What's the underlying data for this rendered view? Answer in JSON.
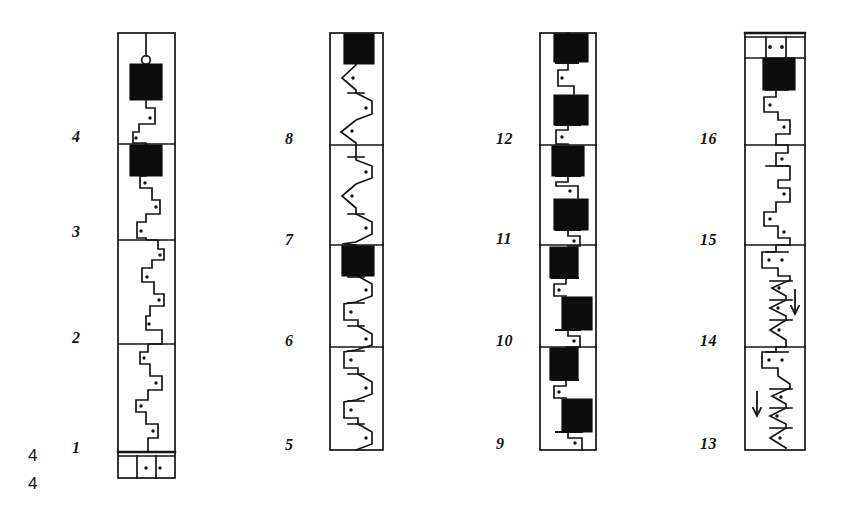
{
  "figure": {
    "kind": "hand-drawn stratigraphic core-log figure",
    "background_color": "#ffffff",
    "ink_color": "#141414",
    "fill_color": "#0d0d0d",
    "width": 843,
    "height": 515,
    "corner_labels": [
      {
        "text": "4",
        "x": 28,
        "y": 455
      },
      {
        "text": "4",
        "x": 28,
        "y": 483
      }
    ],
    "columns": [
      {
        "id": "column-1",
        "name": "core-log-column-1",
        "x": 118,
        "y": 33,
        "width": 57,
        "height": 445,
        "pattern": "stepped-rectilinear",
        "section_labels": [
          {
            "text": "4",
            "label_x": 72,
            "label_y": 129,
            "boundary_y": 144
          },
          {
            "text": "3",
            "label_x": 72,
            "label_y": 224,
            "boundary_y": 240
          },
          {
            "text": "2",
            "label_x": 72,
            "label_y": 330,
            "boundary_y": 344
          },
          {
            "text": "1",
            "label_x": 72,
            "label_y": 440,
            "boundary_y": 452
          }
        ],
        "has_top_hanger": true,
        "has_bottom_cap": true,
        "bottom_cap": {
          "y": 452,
          "height": 26,
          "cells": 4,
          "dot_cells": [
            1,
            2
          ]
        },
        "black_blocks": [
          {
            "y": 63,
            "height": 38,
            "left_offset": 12,
            "width": 32
          },
          {
            "y": 144,
            "height": 32,
            "left_offset": 12,
            "width": 32
          }
        ],
        "arrows": []
      },
      {
        "id": "column-2",
        "name": "core-log-column-2",
        "x": 330,
        "y": 33,
        "width": 53,
        "height": 417,
        "pattern": "triangular-zigzag",
        "section_labels": [
          {
            "text": "8",
            "label_x": 285,
            "label_y": 131,
            "boundary_y": 145
          },
          {
            "text": "7",
            "label_x": 285,
            "label_y": 232,
            "boundary_y": 245
          },
          {
            "text": "6",
            "label_x": 285,
            "label_y": 333,
            "boundary_y": 347
          },
          {
            "text": "5",
            "label_x": 285,
            "label_y": 437,
            "boundary_y": 450
          }
        ],
        "has_top_hanger": false,
        "has_bottom_cap": false,
        "black_blocks": [
          {
            "y": 35,
            "height": 30,
            "left_offset": 14,
            "width": 30
          },
          {
            "y": 245,
            "height": 30,
            "left_offset": 12,
            "width": 32
          }
        ],
        "arrows": []
      },
      {
        "id": "column-3",
        "name": "core-log-column-3",
        "x": 540,
        "y": 33,
        "width": 56,
        "height": 417,
        "pattern": "stepped-blocky",
        "section_labels": [
          {
            "text": "12",
            "label_x": 496,
            "label_y": 131,
            "boundary_y": 145
          },
          {
            "text": "11",
            "label_x": 496,
            "label_y": 231,
            "boundary_y": 245
          },
          {
            "text": "10",
            "label_x": 496,
            "label_y": 333,
            "boundary_y": 347
          },
          {
            "text": "9",
            "label_x": 496,
            "label_y": 436,
            "boundary_y": 450
          }
        ],
        "has_top_hanger": true,
        "has_bottom_cap": false,
        "black_blocks": [
          {
            "y": 35,
            "height": 28,
            "left_offset": 14,
            "width": 34
          },
          {
            "y": 95,
            "height": 30,
            "left_offset": 14,
            "width": 34
          },
          {
            "y": 145,
            "height": 30,
            "left_offset": 12,
            "width": 32
          },
          {
            "y": 198,
            "height": 32,
            "left_offset": 14,
            "width": 34
          },
          {
            "y": 246,
            "height": 32,
            "left_offset": 10,
            "width": 28
          },
          {
            "y": 298,
            "height": 32,
            "left_offset": 22,
            "width": 30
          },
          {
            "y": 348,
            "height": 32,
            "left_offset": 10,
            "width": 28
          },
          {
            "y": 400,
            "height": 32,
            "left_offset": 22,
            "width": 30
          }
        ],
        "arrows": []
      },
      {
        "id": "column-4",
        "name": "core-log-column-4",
        "x": 745,
        "y": 33,
        "width": 60,
        "height": 417,
        "pattern": "mixed-stepped-triangular",
        "section_labels": [
          {
            "text": "16",
            "label_x": 700,
            "label_y": 131,
            "boundary_y": 145
          },
          {
            "text": "15",
            "label_x": 700,
            "label_y": 232,
            "boundary_y": 245
          },
          {
            "text": "14",
            "label_x": 700,
            "label_y": 333,
            "boundary_y": 347
          },
          {
            "text": "13",
            "label_x": 700,
            "label_y": 436,
            "boundary_y": 450
          }
        ],
        "has_top_hanger": false,
        "has_top_cap": true,
        "top_cap": {
          "y": 33,
          "height": 25,
          "cells": 4,
          "dot_cells": [
            1,
            2
          ]
        },
        "has_bottom_cap": false,
        "black_blocks": [
          {
            "y": 58,
            "height": 32,
            "left_offset": 18,
            "width": 32
          }
        ],
        "arrows": [
          {
            "direction": "down",
            "x": 793,
            "y_top": 290,
            "y_bottom": 314
          },
          {
            "direction": "down",
            "x": 757,
            "y_top": 392,
            "y_bottom": 416
          }
        ]
      }
    ]
  }
}
